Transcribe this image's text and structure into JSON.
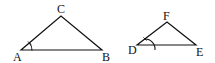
{
  "diagram": {
    "triangles": [
      {
        "name": "triangle-abc",
        "vertices": {
          "A": {
            "label": "A",
            "x": 21,
            "y": 50
          },
          "B": {
            "label": "B",
            "x": 102,
            "y": 50
          },
          "C": {
            "label": "C",
            "x": 61,
            "y": 16
          }
        },
        "marked_angle": "A"
      },
      {
        "name": "triangle-def",
        "vertices": {
          "D": {
            "label": "D",
            "x": 137,
            "y": 45
          },
          "E": {
            "label": "E",
            "x": 196,
            "y": 45
          },
          "F": {
            "label": "F",
            "x": 167,
            "y": 22
          }
        },
        "marked_angle": "D"
      }
    ],
    "stroke_color": "#111111",
    "background": "#ffffff"
  }
}
